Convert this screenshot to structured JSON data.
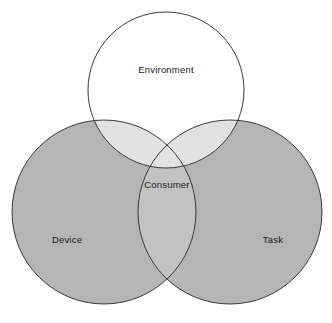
{
  "diagram": {
    "type": "venn",
    "title": "",
    "background_color": "#ffffff",
    "stroke_color": "#3a3a3a",
    "stroke_width": 1,
    "sets": [
      {
        "id": "environment",
        "label": "Environment",
        "fill": "#ffffff",
        "fill_opacity": 1,
        "cx": 166,
        "cy": 90,
        "r": 78,
        "label_x": 166,
        "label_y": 70
      },
      {
        "id": "device",
        "label": "Device",
        "fill": "#b5b5b5",
        "fill_opacity": 1,
        "cx": 104,
        "cy": 212,
        "r": 92,
        "label_x": 67,
        "label_y": 240
      },
      {
        "id": "task",
        "label": "Task",
        "fill": "#b5b5b5",
        "fill_opacity": 1,
        "cx": 230,
        "cy": 212,
        "r": 92,
        "label_x": 273,
        "label_y": 240
      }
    ],
    "intersections": [
      {
        "id": "environment-device",
        "label": "",
        "fill": "#e2e2e2"
      },
      {
        "id": "environment-task",
        "label": "",
        "fill": "#e2e2e2"
      },
      {
        "id": "device-task",
        "label": "",
        "fill": "#c2c2c2"
      },
      {
        "id": "environment-device-task",
        "label": "Consumer",
        "fill": "#e2e2e2",
        "label_x": 167,
        "label_y": 185
      }
    ]
  }
}
